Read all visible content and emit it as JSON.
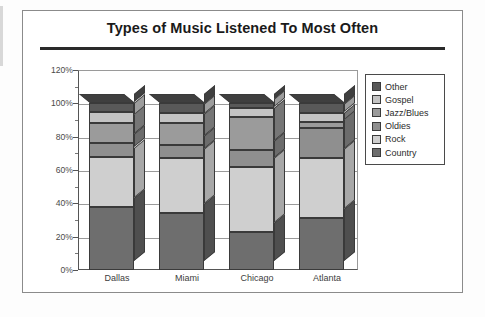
{
  "frame": {
    "outer_border_color": "#8b8b8b"
  },
  "chart_data": {
    "type": "bar",
    "subtype": "stacked-percent-3d",
    "title": "Types of Music Listened To Most Often",
    "xlabel": "",
    "ylabel": "",
    "categories": [
      "Dallas",
      "Miami",
      "Chicago",
      "Atlanta"
    ],
    "ylim": [
      0,
      120
    ],
    "ytick_labels": [
      "0%",
      "20%",
      "40%",
      "60%",
      "80%",
      "100%",
      "120%"
    ],
    "ytick_values": [
      0,
      20,
      40,
      60,
      80,
      100,
      120
    ],
    "minor_tick_interval": 10,
    "grid": true,
    "grid_axis": "y",
    "legend_position": "right",
    "legend_order": [
      "Other",
      "Gospel",
      "Jazz/Blues",
      "Oldies",
      "Rock",
      "Country"
    ],
    "stack_order_bottom_to_top": [
      "Country",
      "Rock",
      "Oldies",
      "Jazz/Blues",
      "Gospel",
      "Other"
    ],
    "series": [
      {
        "name": "Country",
        "color": "#6e6e6e",
        "side_color": "#4f4f4f",
        "values": [
          38,
          34,
          23,
          31
        ]
      },
      {
        "name": "Rock",
        "color": "#cfcfcf",
        "side_color": "#a8a8a8",
        "values": [
          30,
          33,
          39,
          36
        ]
      },
      {
        "name": "Oldies",
        "color": "#8f8f8f",
        "side_color": "#6c6c6c",
        "values": [
          8,
          8,
          10,
          18
        ]
      },
      {
        "name": "Jazz/Blues",
        "color": "#9b9b9b",
        "side_color": "#767676",
        "values": [
          12,
          13,
          20,
          4
        ]
      },
      {
        "name": "Gospel",
        "color": "#c4c4c4",
        "side_color": "#9d9d9d",
        "values": [
          7,
          6,
          5,
          5
        ]
      },
      {
        "name": "Other",
        "color": "#595959",
        "side_color": "#3f3f3f",
        "values": [
          5,
          6,
          3,
          6
        ]
      }
    ]
  }
}
